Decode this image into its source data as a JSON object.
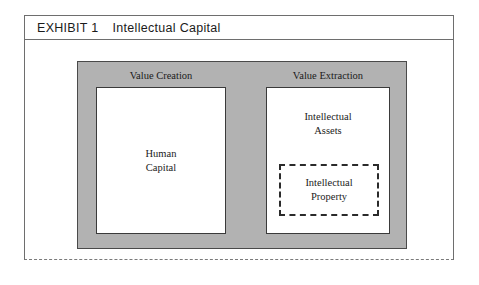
{
  "exhibit": {
    "number_label": "EXHIBIT 1",
    "title": "Intellectual Capital"
  },
  "diagram": {
    "columns": [
      {
        "label": "Value Creation",
        "box_text": "Human\nCapital"
      },
      {
        "label": "Value Extraction",
        "box_text": "Intellectual\nAssets",
        "inner_box_text": "Intellectual\nProperty"
      }
    ]
  },
  "colors": {
    "panel_fill": "#b2b2b2",
    "panel_border": "#4a4a4a",
    "box_fill": "#ffffff",
    "box_border": "#3a3a3a",
    "dashed_border": "#2b2b2b",
    "frame_border": "#6e6e6e",
    "text": "#1b1b1b"
  }
}
